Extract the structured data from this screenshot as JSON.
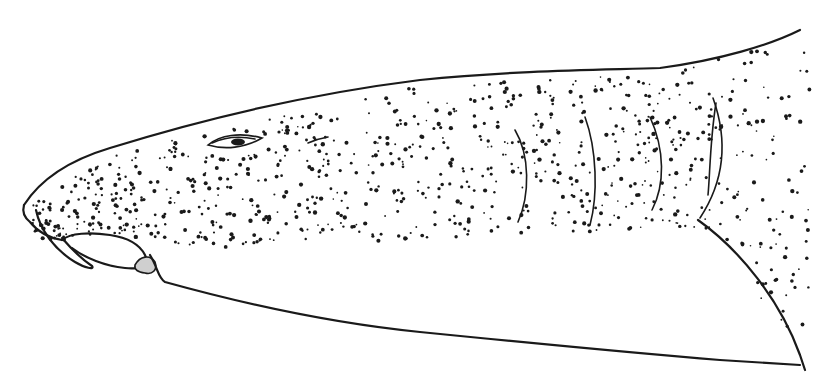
{
  "illustration": {
    "subject": "shark head, lateral view",
    "style": "ink line drawing with stippling",
    "colors": {
      "ink": "#1a1a1a",
      "background": "#ffffff",
      "shade": "#cfcfcf"
    },
    "features": [
      "snout",
      "nasal-barbel",
      "mouth",
      "eye",
      "spiracle",
      "gill-slits",
      "pectoral-fin-base",
      "dorsal-outline",
      "ventral-outline"
    ],
    "gill_slit_count": 5
  }
}
